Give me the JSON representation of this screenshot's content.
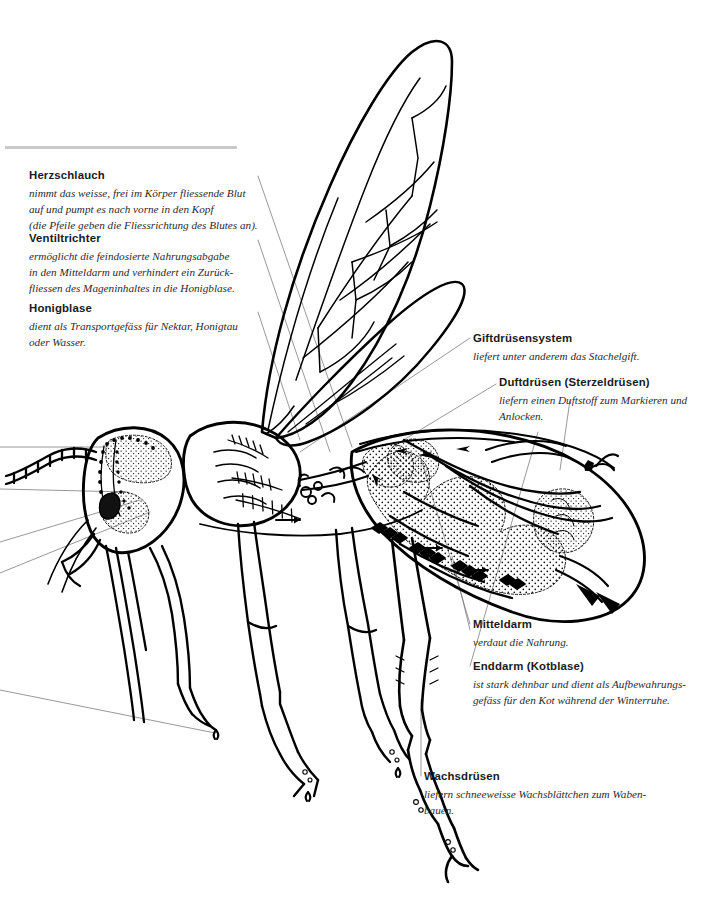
{
  "document": {
    "title": "Anatomie der Honigbiene",
    "language": "de",
    "illustration_name": "bee-anatomy-illustration",
    "background_color": "#ffffff",
    "ink_color": "#000000",
    "rule_color": "#c9c9c9"
  },
  "annotations": [
    {
      "id": "herzschlauch",
      "title": "Herzschlauch",
      "lines": [
        "nimmt das weisse, frei im Körper fliessende Blut",
        "auf und pumpt es nach vorne in den Kopf",
        "(die Pfeile geben die Fliessrichtung des Blutes an)."
      ]
    },
    {
      "id": "ventiltrichter",
      "title": "Ventiltrichter",
      "lines": [
        "ermöglicht die feindosierte Nahrungsabgabe",
        "in den Mitteldarm und verhindert ein Zurück-",
        "fliessen des Mageninhaltes in die Honigblase."
      ]
    },
    {
      "id": "honigblase",
      "title": "Honigblase",
      "lines": [
        "dient als Transportgefäss für Nektar, Honigtau",
        "oder Wasser."
      ]
    },
    {
      "id": "giftdruesensystem",
      "title": "Giftdrüsensystem",
      "lines": [
        "liefert unter anderem das Stachelgift."
      ]
    },
    {
      "id": "duftdruesen",
      "title": "Duftdrüsen (Sterzeldrüsen)",
      "lines": [
        "liefern einen Duftstoff zum Markieren und",
        "Anlocken."
      ]
    },
    {
      "id": "mitteldarm",
      "title": "Mitteldarm",
      "lines": [
        "verdaut die Nahrung."
      ]
    },
    {
      "id": "enddarm",
      "title": "Enddarm (Kotblase)",
      "lines": [
        "ist stark dehnbar und dient als Aufbewahrungs-",
        "gefäss für den Kot während der Winterruhe."
      ]
    },
    {
      "id": "wachsdruesen",
      "title": "Wachsdrüsen",
      "lines": [
        "liefern schneeweisse Wachsblättchen zum Waben-",
        "bauen."
      ]
    }
  ]
}
